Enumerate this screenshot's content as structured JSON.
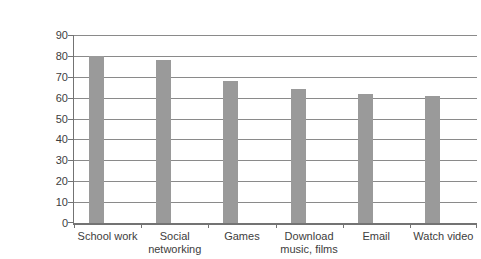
{
  "chart_data": {
    "type": "bar",
    "title": "",
    "xlabel": "",
    "ylabel": "",
    "categories": [
      "School work",
      "Social networking",
      "Games",
      "Download music, films",
      "Email",
      "Watch video"
    ],
    "category_label_lines": [
      [
        "School work"
      ],
      [
        "Social",
        "networking"
      ],
      [
        "Games"
      ],
      [
        "Download",
        "music, films"
      ],
      [
        "Email"
      ],
      [
        "Watch video"
      ]
    ],
    "values": [
      80,
      78,
      68,
      64,
      62,
      61
    ],
    "ylim": [
      0,
      90
    ],
    "yticks": [
      0,
      10,
      20,
      30,
      40,
      50,
      60,
      70,
      80,
      90
    ],
    "grid": true,
    "legend_position": "none",
    "bar_color": "#9a9a9a",
    "gridline_color": "#8a8a8a",
    "axis_color": "#737373",
    "text_color": "#3d3d3d"
  }
}
